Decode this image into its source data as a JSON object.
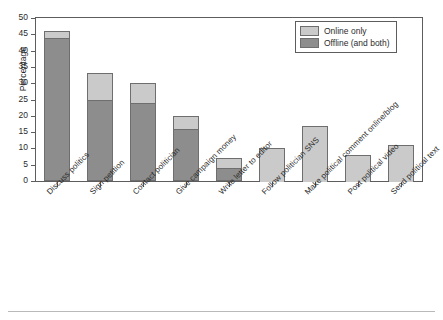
{
  "figure": {
    "truncated_caption": "",
    "bottom_rule": true
  },
  "chart_data": {
    "type": "bar",
    "subtype": "stacked-vertical",
    "title": "",
    "xlabel": "",
    "ylabel": "Percentage",
    "ylim": [
      0,
      50
    ],
    "ytick_step": 5,
    "yticks": [
      0,
      5,
      10,
      15,
      20,
      25,
      30,
      35,
      40,
      45,
      50
    ],
    "grid": false,
    "legend_position": "top-right",
    "categories": [
      "Discuss politics",
      "Sign petition",
      "Contact politician",
      "Give campaign money",
      "Write letter to editor",
      "Follow politician SNS",
      "Make political comment online/blog",
      "Post political video",
      "Send political text"
    ],
    "series": [
      {
        "name": "Offline (and both)",
        "color": "#8d8d8d",
        "values": [
          44,
          25,
          24,
          16,
          4,
          0,
          0,
          0,
          0
        ]
      },
      {
        "name": "Online only",
        "color": "#cacaca",
        "values": [
          2,
          8,
          6,
          4,
          3,
          10,
          17,
          8,
          11
        ]
      }
    ],
    "totals": [
      46,
      33,
      30,
      20,
      7,
      10,
      17,
      8,
      11
    ]
  },
  "legend": {
    "items": [
      {
        "label": "Online only",
        "color": "#cacaca"
      },
      {
        "label": "Offline (and both)",
        "color": "#8d8d8d"
      }
    ]
  },
  "axes": {
    "y_title": "Percentage",
    "y_labels": [
      "50",
      "45",
      "40",
      "35",
      "30",
      "25",
      "20",
      "15",
      "10",
      "5",
      "0"
    ]
  }
}
